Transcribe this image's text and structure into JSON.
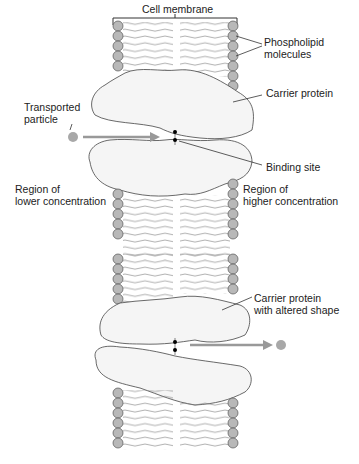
{
  "diagram": {
    "title": "Cell membrane",
    "labels": {
      "phospholipid": [
        "Phospholipid",
        "molecules"
      ],
      "carrier_protein": "Carrier protein",
      "transported_particle": [
        "Transported",
        "particle"
      ],
      "binding_site": "Binding site",
      "lower_concentration": [
        "Region of",
        "lower concentration"
      ],
      "higher_concentration": [
        "Region of",
        "higher concentration"
      ],
      "altered_shape": [
        "Carrier protein",
        "with altered shape"
      ]
    },
    "colors": {
      "head_fill": "#b8b8b8",
      "head_stroke": "#555555",
      "protein_fill": "#f5f5f5",
      "protein_stroke": "#444444",
      "arrow": "#999999",
      "particle": "#a8a8a8",
      "line": "#333333"
    }
  }
}
